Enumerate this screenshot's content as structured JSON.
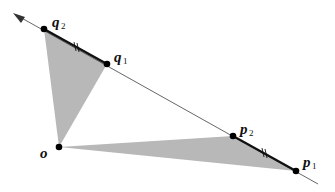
{
  "diagram": {
    "type": "geometric-construction",
    "fill_color": "#b8b8b8",
    "line_color": "#333333",
    "points": {
      "o": {
        "label": "o",
        "sub": "",
        "x": 59,
        "y": 147
      },
      "q2": {
        "label": "q",
        "sub": "2",
        "x": 44,
        "y": 29
      },
      "q1": {
        "label": "q",
        "sub": "1",
        "x": 107,
        "y": 64
      },
      "p2": {
        "label": "p",
        "sub": "2",
        "x": 233,
        "y": 136
      },
      "p1": {
        "label": "p",
        "sub": "1",
        "x": 296,
        "y": 171
      }
    },
    "line": {
      "from": [
        14,
        14
      ],
      "to": [
        318,
        184
      ],
      "arrow_at_start": true
    },
    "triangles": [
      [
        "o",
        "q2",
        "q1"
      ],
      [
        "o",
        "p2",
        "p1"
      ]
    ],
    "equal_segments": [
      [
        "q2",
        "q1"
      ],
      [
        "p2",
        "p1"
      ]
    ],
    "tick_mark": "||"
  }
}
